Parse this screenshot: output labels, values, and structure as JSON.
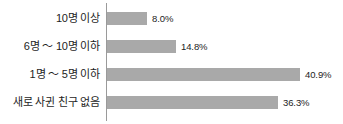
{
  "chart_data": {
    "type": "bar",
    "orientation": "horizontal",
    "title": "",
    "xlabel": "",
    "ylabel": "",
    "grid": false,
    "legend": false,
    "xlim": [
      0,
      45
    ],
    "axis_line": true,
    "bar_color": "#a9a9a9",
    "text_color": "#1d1d1d",
    "categories": [
      "10명 이상",
      "6명 ～ 10명 이하",
      "1명 ～ 5명 이하",
      "새로 사귄 친구 없음"
    ],
    "values": [
      8.0,
      14.8,
      40.9,
      36.3
    ],
    "value_labels": [
      "8.0%",
      "14.8%",
      "40.9%",
      "36.3%"
    ],
    "bars": [
      {
        "label": "10명 이상",
        "value": 8.0,
        "value_label": "8.0%",
        "pixel_width": "40px"
      },
      {
        "label": "6명 ～ 10명 이하",
        "value": 14.8,
        "value_label": "14.8%",
        "pixel_width": "69px"
      },
      {
        "label": "1명 ～ 5명 이하",
        "value": 40.9,
        "value_label": "40.9%",
        "pixel_width": "193px"
      },
      {
        "label": "새로 사귄 친구 없음",
        "value": 36.3,
        "value_label": "36.3%",
        "pixel_width": "171px"
      }
    ]
  }
}
